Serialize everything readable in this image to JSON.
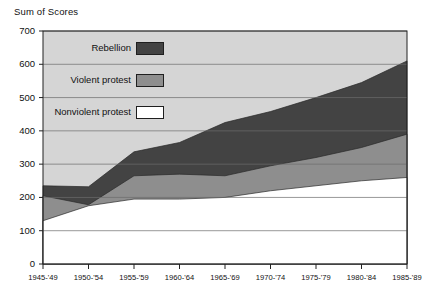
{
  "chart_data": {
    "type": "area",
    "title": "Sum of Scores",
    "subtitle": "",
    "xlabel": "",
    "ylabel": "Sum of Scores",
    "stacked": true,
    "grid": true,
    "legend_position": "inside-top-left",
    "ylim": [
      0,
      700
    ],
    "yticks": [
      0,
      100,
      200,
      300,
      400,
      500,
      600,
      700
    ],
    "ytick_labels": [
      "0",
      "100",
      "200",
      "300",
      "400",
      "500",
      "600",
      "700"
    ],
    "categories": [
      "1945-'49",
      "1950-'54",
      "1955-'59",
      "1960-'64",
      "1965-'69",
      "1970-'74",
      "1975-'79",
      "1980-'84",
      "1985-'89"
    ],
    "series": [
      {
        "name": "Nonviolent protest",
        "color": "#ffffff",
        "values": [
          130,
          175,
          195,
          195,
          200,
          220,
          235,
          250,
          260
        ]
      },
      {
        "name": "Violent protest",
        "color": "#8e8e8e",
        "values": [
          75,
          3,
          70,
          75,
          65,
          75,
          85,
          100,
          130
        ]
      },
      {
        "name": "Rebellion",
        "color": "#434343",
        "values": [
          30,
          54,
          72,
          95,
          160,
          163,
          180,
          195,
          220
        ]
      }
    ],
    "cumulative_tops": {
      "nonviolent": [
        130,
        175,
        195,
        195,
        200,
        220,
        235,
        250,
        260
      ],
      "violent": [
        205,
        178,
        265,
        270,
        265,
        295,
        320,
        350,
        390
      ],
      "rebellion": [
        235,
        232,
        337,
        365,
        425,
        458,
        500,
        545,
        610
      ]
    },
    "plot_background": "#d5d5d5"
  },
  "legend": {
    "items": [
      {
        "label": "Rebellion",
        "swatch": "#434343"
      },
      {
        "label": "Violent protest",
        "swatch": "#8e8e8e"
      },
      {
        "label": "Nonviolent protest",
        "swatch": "#ffffff"
      }
    ]
  }
}
